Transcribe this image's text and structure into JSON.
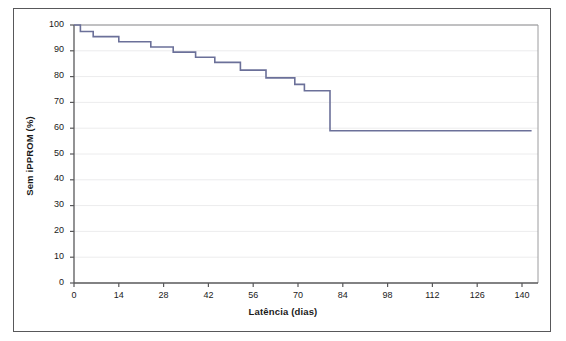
{
  "figure": {
    "name": "kaplan-meier-ippprom-latency",
    "border_color": "#58585a",
    "background": "#ffffff"
  },
  "chart_data": {
    "type": "line",
    "subtype": "kaplan-meier-step",
    "title": "",
    "subtitle": "",
    "xlabel": "Latência (dias)",
    "ylabel": "Sem iPPROM (%)",
    "xlim": [
      0,
      145
    ],
    "ylim": [
      0,
      100
    ],
    "xticks": [
      0,
      14,
      28,
      42,
      56,
      70,
      84,
      98,
      112,
      126,
      140
    ],
    "xtick_labels": [
      "0",
      "14",
      "28",
      "42",
      "56",
      "70",
      "84",
      "98",
      "112",
      "126",
      "140"
    ],
    "yticks": [
      0,
      10,
      20,
      30,
      40,
      50,
      60,
      70,
      80,
      90,
      100
    ],
    "ytick_labels": [
      "0",
      "10",
      "20",
      "30",
      "40",
      "50",
      "60",
      "70",
      "80",
      "90",
      "100"
    ],
    "grid": "horizontal",
    "grid_color": "#ececed",
    "legend": "none",
    "series": [
      {
        "name": "Sem iPPROM",
        "color": "#6b7099",
        "line_width": 1.6,
        "step": "post",
        "x": [
          0,
          1,
          2,
          4,
          6,
          9,
          14,
          19,
          24,
          27,
          31,
          34,
          38,
          42,
          44,
          47,
          52,
          56,
          60,
          65,
          69,
          72,
          76,
          80,
          143
        ],
        "y": [
          100,
          100,
          97.5,
          97.5,
          95.5,
          95.5,
          93.5,
          93.5,
          91.5,
          91.5,
          89.5,
          89.5,
          87.5,
          87.5,
          85.5,
          85.5,
          82.5,
          82.5,
          79.5,
          79.5,
          77,
          74.5,
          74.5,
          59,
          59
        ],
        "points": [
          {
            "x": 0,
            "y": 100
          },
          {
            "x": 2,
            "y": 97.5
          },
          {
            "x": 6,
            "y": 95.5
          },
          {
            "x": 14,
            "y": 93.5
          },
          {
            "x": 24,
            "y": 91.5
          },
          {
            "x": 31,
            "y": 89.5
          },
          {
            "x": 38,
            "y": 87.5
          },
          {
            "x": 44,
            "y": 85.5
          },
          {
            "x": 52,
            "y": 82.5
          },
          {
            "x": 60,
            "y": 79.5
          },
          {
            "x": 69,
            "y": 77
          },
          {
            "x": 72,
            "y": 74.5
          },
          {
            "x": 80,
            "y": 59
          },
          {
            "x": 143,
            "y": 59
          }
        ]
      }
    ]
  },
  "axes": {
    "x_title": "Latência (dias)",
    "y_title": "Sem iPPROM (%)",
    "x_tick_labels": [
      "0",
      "14",
      "28",
      "42",
      "56",
      "70",
      "84",
      "98",
      "112",
      "126",
      "140"
    ],
    "y_tick_labels": [
      "100",
      "90",
      "80",
      "70",
      "60",
      "50",
      "40",
      "30",
      "20",
      "10",
      "0"
    ]
  }
}
